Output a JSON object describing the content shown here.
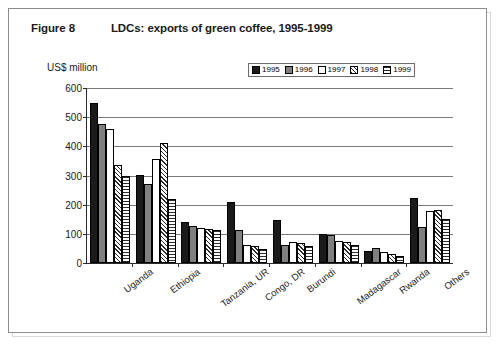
{
  "figure": {
    "label": "Figure 8",
    "title": "LDCs: exports of green coffee, 1995-1999"
  },
  "chart_data": {
    "type": "bar",
    "title": "LDCs: exports of green coffee, 1995-1999",
    "xlabel": "",
    "ylabel": "US$ million",
    "ylim": [
      0,
      600
    ],
    "yticks": [
      0,
      100,
      200,
      300,
      400,
      500,
      600
    ],
    "grid": true,
    "legend_position": "top-right",
    "categories": [
      "Uganda",
      "Ethiopia",
      "Tanzania, UR",
      "Congo, DR",
      "Burundi",
      "Madagascar",
      "Rwanda",
      "Others"
    ],
    "series": [
      {
        "name": "1995",
        "pattern": "solid-black",
        "color": "#1a1a1a",
        "values": [
          550,
          303,
          140,
          210,
          148,
          100,
          40,
          222
        ]
      },
      {
        "name": "1996",
        "pattern": "solid-gray",
        "color": "#808080",
        "values": [
          478,
          270,
          128,
          113,
          62,
          95,
          50,
          122
        ]
      },
      {
        "name": "1997",
        "pattern": "white",
        "color": "#ffffff",
        "values": [
          460,
          357,
          120,
          62,
          72,
          75,
          38,
          178
        ]
      },
      {
        "name": "1998",
        "pattern": "diagonal-hatch",
        "color": "#ffffff",
        "values": [
          337,
          410,
          118,
          58,
          68,
          72,
          32,
          182
        ]
      },
      {
        "name": "1999",
        "pattern": "horizontal-lines",
        "color": "#ffffff",
        "values": [
          300,
          218,
          112,
          48,
          60,
          62,
          25,
          150
        ]
      }
    ]
  },
  "colors": {
    "frame": "#8d8d8d",
    "frame_shadow": "#d8d8d8",
    "axis": "#2b2b2b",
    "gridline": "#7a7a7a",
    "text": "#1a1a1a"
  }
}
